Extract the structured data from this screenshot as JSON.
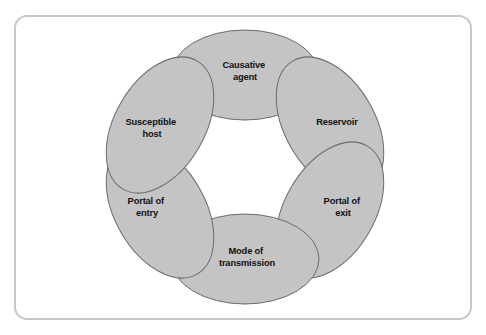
{
  "figure": {
    "frame": {
      "border_color": "#c8c8c8",
      "background_color": "#ffffff",
      "corner_radius": 13
    }
  },
  "chart_data": {
    "type": "diagram",
    "diagram_kind": "cycle",
    "node_count": 6,
    "layout": "six overlapping ellipses arranged in a ring with a white hexagonal hole at the center",
    "style": {
      "ellipse_fill": "#c4c4c4",
      "ellipse_stroke": "#6b6b6b",
      "ellipse_stroke_width": 1,
      "label_color": "#111111",
      "opaque_overlaps": true
    },
    "nodes": [
      {
        "id": "causative-agent",
        "label": "Causative agent",
        "label_lines": [
          "Causative",
          "agent"
        ],
        "position": "top",
        "order": 1,
        "cx": 245,
        "cy": 75,
        "rx": 74,
        "ry": 45,
        "rotation_deg": 0,
        "label_x": 245,
        "label_y": 66
      },
      {
        "id": "reservoir",
        "label": "Reservoir",
        "label_lines": [
          "Reservoir"
        ],
        "position": "top-right",
        "order": 2,
        "cx": 330,
        "cy": 125,
        "rx": 74,
        "ry": 45,
        "rotation_deg": 60,
        "label_x": 337,
        "label_y": 123
      },
      {
        "id": "portal-of-exit",
        "label": "Portal of exit",
        "label_lines": [
          "Portal of",
          "exit"
        ],
        "position": "bottom-right",
        "order": 3,
        "cx": 330,
        "cy": 210,
        "rx": 74,
        "ry": 45,
        "rotation_deg": 120,
        "label_x": 343,
        "label_y": 202
      },
      {
        "id": "mode-of-transmission",
        "label": "Mode of transmission",
        "label_lines": [
          "Mode of",
          "transmission"
        ],
        "position": "bottom",
        "order": 4,
        "cx": 245,
        "cy": 259,
        "rx": 74,
        "ry": 45,
        "rotation_deg": 0,
        "label_x": 247,
        "label_y": 252
      },
      {
        "id": "portal-of-entry",
        "label": "Portal of entry",
        "label_lines": [
          "Portal of",
          "entry"
        ],
        "position": "bottom-left",
        "order": 5,
        "cx": 160,
        "cy": 210,
        "rx": 74,
        "ry": 45,
        "rotation_deg": 60,
        "label_x": 147,
        "label_y": 202
      },
      {
        "id": "susceptible-host",
        "label": "Susceptible host",
        "label_lines": [
          "Susceptible",
          "host"
        ],
        "position": "top-left",
        "order": 6,
        "cx": 160,
        "cy": 125,
        "rx": 74,
        "ry": 45,
        "rotation_deg": 120,
        "label_x": 152,
        "label_y": 123
      }
    ]
  }
}
